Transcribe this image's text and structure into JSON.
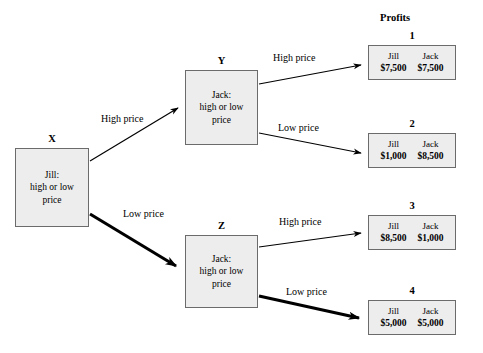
{
  "diagram": {
    "profits_heading": "Profits",
    "nodes": [
      {
        "tag": "X",
        "lines": [
          "Jill:",
          "high or low",
          "price"
        ],
        "x": 15,
        "y": 148,
        "w": 74,
        "h": 79,
        "tag_x": 15,
        "tag_y": 133,
        "tag_w": 74
      },
      {
        "tag": "Y",
        "lines": [
          "Jack:",
          "high or low",
          "price"
        ],
        "x": 185,
        "y": 70,
        "w": 73,
        "h": 75,
        "tag_x": 185,
        "tag_y": 55,
        "tag_w": 73
      },
      {
        "tag": "Z",
        "lines": [
          "Jack:",
          "high or low",
          "price"
        ],
        "x": 185,
        "y": 235,
        "w": 73,
        "h": 73,
        "tag_x": 185,
        "tag_y": 220,
        "tag_w": 73
      }
    ],
    "payoffs": [
      {
        "tag": "1",
        "left_name": "Jill",
        "left_value": "$7,500",
        "right_name": "Jack",
        "right_value": "$7,500",
        "x": 368,
        "y": 45,
        "w": 88,
        "h": 35,
        "tag_x": 368,
        "tag_y": 30,
        "tag_w": 88
      },
      {
        "tag": "2",
        "left_name": "Jill",
        "left_value": "$1,000",
        "right_name": "Jack",
        "right_value": "$8,500",
        "x": 368,
        "y": 133,
        "w": 88,
        "h": 35,
        "tag_x": 368,
        "tag_y": 118,
        "tag_w": 88
      },
      {
        "tag": "3",
        "left_name": "Jill",
        "left_value": "$8,500",
        "right_name": "Jack",
        "right_value": "$1,000",
        "x": 368,
        "y": 215,
        "w": 88,
        "h": 35,
        "tag_x": 368,
        "tag_y": 200,
        "tag_w": 88
      },
      {
        "tag": "4",
        "left_name": "Jill",
        "left_value": "$5,000",
        "right_name": "Jack",
        "right_value": "$5,000",
        "x": 368,
        "y": 300,
        "w": 88,
        "h": 35,
        "tag_x": 368,
        "tag_y": 285,
        "tag_w": 88
      }
    ],
    "edge_labels": [
      {
        "text": "High price",
        "x": 101,
        "y": 113
      },
      {
        "text": "Low price",
        "x": 123,
        "y": 208
      },
      {
        "text": "High price",
        "x": 273,
        "y": 52
      },
      {
        "text": "Low price",
        "x": 278,
        "y": 122
      },
      {
        "text": "High price",
        "x": 279,
        "y": 216
      },
      {
        "text": "Low price",
        "x": 286,
        "y": 286
      }
    ],
    "heading_pos": {
      "x": 380,
      "y": 12
    },
    "colors": {
      "box_fill": "#ededed",
      "box_border": "#6b6b6b",
      "line": "#000000",
      "text": "#000000",
      "background": "#ffffff"
    }
  }
}
